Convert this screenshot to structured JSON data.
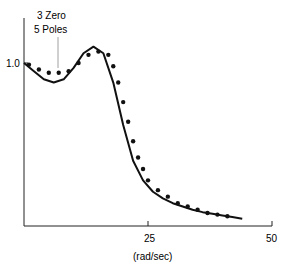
{
  "chart_data": {
    "type": "line",
    "title": "",
    "xlabel": "(rad/sec)",
    "ylabel": "",
    "xlim": [
      0,
      50
    ],
    "x_ticks": [
      "25",
      "50"
    ],
    "y_ticks": [
      "1.0"
    ],
    "annotation": [
      "3 Zero",
      "5 Poles"
    ],
    "series": [
      {
        "name": "model fit (3 zero, 5 poles)",
        "style": "solid line",
        "x": [
          0,
          2,
          4,
          6,
          8,
          10,
          12,
          14,
          16,
          18,
          20,
          22,
          24,
          26,
          28,
          30,
          32,
          34,
          36,
          38,
          40,
          42,
          44
        ],
        "y": [
          1.0,
          0.95,
          0.9,
          0.88,
          0.9,
          0.97,
          1.06,
          1.1,
          1.06,
          0.88,
          0.62,
          0.4,
          0.28,
          0.21,
          0.17,
          0.14,
          0.12,
          0.1,
          0.085,
          0.075,
          0.065,
          0.055,
          0.045
        ]
      },
      {
        "name": "measured data",
        "style": "dots",
        "x": [
          1,
          3,
          5,
          7,
          9,
          11,
          13,
          15,
          17,
          18,
          19,
          20,
          21,
          22,
          23,
          24,
          25,
          27,
          29,
          31,
          33,
          35,
          37,
          39,
          41
        ],
        "y": [
          0.99,
          0.96,
          0.94,
          0.94,
          0.95,
          1.0,
          1.05,
          1.07,
          1.05,
          0.98,
          0.88,
          0.76,
          0.64,
          0.52,
          0.42,
          0.35,
          0.28,
          0.22,
          0.18,
          0.14,
          0.12,
          0.1,
          0.08,
          0.07,
          0.06
        ]
      }
    ]
  }
}
